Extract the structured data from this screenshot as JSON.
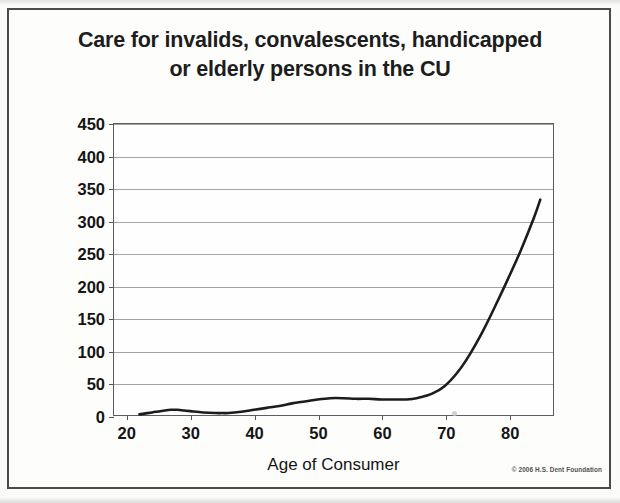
{
  "figure": {
    "copyright": "© 2006 H.S. Dent Foundation"
  },
  "chart_data": {
    "type": "line",
    "title": "Care for invalids, convalescents, handicapped or elderly persons in the CU",
    "title_lines": [
      "Care for invalids, convalescents, handicapped",
      "or elderly persons in the CU"
    ],
    "xlabel": "Age of Consumer",
    "ylabel": "Avg. Annual Expenditure",
    "xlim": [
      18,
      87
    ],
    "ylim": [
      0,
      450
    ],
    "grid": true,
    "legend": null,
    "yticks": [
      0,
      50,
      100,
      150,
      200,
      250,
      300,
      350,
      400,
      450
    ],
    "ytick_labels": [
      "0",
      "50",
      "100",
      "150",
      "200",
      "250",
      "300",
      "350",
      "400",
      "450"
    ],
    "xticks": [
      20,
      30,
      40,
      50,
      60,
      70,
      80
    ],
    "xtick_labels": [
      "20",
      "30",
      "40",
      "50",
      "60",
      "70",
      "80"
    ],
    "series": [
      {
        "name": "Avg. Annual Expenditure",
        "color": "#1c1c1c",
        "x": [
          22,
          24,
          26,
          27,
          28,
          29,
          30,
          32,
          34,
          35,
          36,
          38,
          40,
          42,
          44,
          46,
          48,
          50,
          52,
          54,
          56,
          58,
          60,
          62,
          64,
          65,
          66,
          68,
          70,
          72,
          74,
          76,
          78,
          80,
          82,
          84,
          85
        ],
        "values": [
          1,
          4,
          7,
          8,
          8,
          7,
          6,
          4,
          3,
          3,
          3,
          5,
          8,
          11,
          14,
          18,
          21,
          24,
          26,
          26,
          25,
          25,
          24,
          24,
          24,
          25,
          27,
          33,
          45,
          66,
          95,
          130,
          170,
          212,
          256,
          305,
          333
        ]
      }
    ]
  }
}
